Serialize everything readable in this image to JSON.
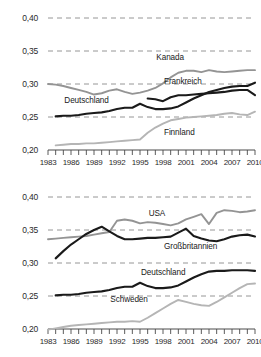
{
  "chart_data": [
    {
      "type": "line",
      "title": "",
      "xlabel": "",
      "ylabel": "",
      "xlim": [
        1983,
        2010
      ],
      "ylim": [
        0.2,
        0.4
      ],
      "grid": true,
      "legend_position": "inline-labels",
      "ytick_labels": [
        "0,40",
        "0,35",
        "0,30",
        "0,25",
        "0,20"
      ],
      "ytick_values": [
        0.4,
        0.35,
        0.3,
        0.25,
        0.2
      ],
      "xtick_labels": [
        "1983",
        "1986",
        "1989",
        "1992",
        "1995",
        "1998",
        "2001",
        "2004",
        "2007",
        "2010"
      ],
      "xtick_values": [
        1983,
        1986,
        1989,
        1992,
        1995,
        1998,
        2001,
        2004,
        2007,
        2010
      ],
      "series": [
        {
          "name": "Kanada",
          "color": "#949494",
          "label_x": 2000,
          "label_y": 0.338,
          "x": [
            1983,
            1984,
            1985,
            1986,
            1987,
            1988,
            1989,
            1990,
            1991,
            1992,
            1993,
            1994,
            1995,
            1996,
            1997,
            1998,
            1999,
            2000,
            2001,
            2002,
            2003,
            2004,
            2005,
            2006,
            2007,
            2008,
            2009,
            2010
          ],
          "values": [
            0.3,
            0.299,
            0.297,
            0.294,
            0.291,
            0.288,
            0.284,
            0.286,
            0.29,
            0.292,
            0.288,
            0.285,
            0.287,
            0.29,
            0.294,
            0.301,
            0.31,
            0.317,
            0.32,
            0.32,
            0.318,
            0.321,
            0.319,
            0.318,
            0.319,
            0.32,
            0.321,
            0.321
          ]
        },
        {
          "name": "Frankreich",
          "color": "#1a1a1a",
          "label_x": 2001,
          "label_y": 0.302,
          "x": [
            1996,
            1997,
            1998,
            1999,
            2000,
            2001,
            2002,
            2003,
            2004,
            2005,
            2006,
            2007,
            2008,
            2009,
            2010
          ],
          "values": [
            0.278,
            0.277,
            0.274,
            0.28,
            0.283,
            0.283,
            0.284,
            0.285,
            0.286,
            0.287,
            0.288,
            0.29,
            0.291,
            0.291,
            0.283
          ]
        },
        {
          "name": "Deutschland",
          "color": "#1a1a1a",
          "label_x": 1988,
          "label_y": 0.272,
          "x": [
            1984,
            1985,
            1986,
            1987,
            1988,
            1989,
            1990,
            1991,
            1992,
            1993,
            1994,
            1995,
            1996,
            1997,
            1998,
            1999,
            2000,
            2001,
            2002,
            2003,
            2004,
            2005,
            2006,
            2007,
            2008,
            2009,
            2010
          ],
          "values": [
            0.251,
            0.252,
            0.252,
            0.253,
            0.255,
            0.256,
            0.257,
            0.259,
            0.262,
            0.264,
            0.264,
            0.27,
            0.265,
            0.262,
            0.262,
            0.263,
            0.266,
            0.272,
            0.278,
            0.283,
            0.288,
            0.291,
            0.294,
            0.296,
            0.297,
            0.297,
            0.302
          ]
        },
        {
          "name": "Finnland",
          "color": "#b5b5b5",
          "label_x": 2001,
          "label_y": 0.224,
          "x": [
            1984,
            1985,
            1986,
            1987,
            1988,
            1989,
            1990,
            1991,
            1992,
            1993,
            1994,
            1995,
            1996,
            1997,
            1998,
            1999,
            2000,
            2001,
            2002,
            2003,
            2004,
            2005,
            2006,
            2007,
            2008,
            2009,
            2010
          ],
          "values": [
            0.207,
            0.208,
            0.209,
            0.209,
            0.21,
            0.21,
            0.211,
            0.212,
            0.213,
            0.214,
            0.215,
            0.216,
            0.226,
            0.234,
            0.24,
            0.245,
            0.247,
            0.249,
            0.25,
            0.251,
            0.252,
            0.253,
            0.255,
            0.256,
            0.254,
            0.253,
            0.258
          ]
        }
      ]
    },
    {
      "type": "line",
      "title": "",
      "xlabel": "",
      "ylabel": "",
      "xlim": [
        1983,
        2010
      ],
      "ylim": [
        0.2,
        0.4
      ],
      "grid": true,
      "legend_position": "inline-labels",
      "ytick_labels": [
        "0,40",
        "0,35",
        "0,30",
        "0,25",
        "0,20"
      ],
      "ytick_values": [
        0.4,
        0.35,
        0.3,
        0.25,
        0.2
      ],
      "xtick_labels": [
        "1983",
        "1986",
        "1989",
        "1992",
        "1995",
        "1998",
        "2001",
        "2004",
        "2007",
        "2010"
      ],
      "xtick_values": [
        1983,
        1986,
        1989,
        1992,
        1995,
        1998,
        2001,
        2004,
        2007,
        2010
      ],
      "series": [
        {
          "name": "USA",
          "color": "#949494",
          "label_x": 1999,
          "label_y": 0.372,
          "x": [
            1983,
            1984,
            1985,
            1986,
            1987,
            1988,
            1989,
            1990,
            1991,
            1992,
            1993,
            1994,
            1995,
            1996,
            1997,
            1998,
            1999,
            2000,
            2001,
            2002,
            2003,
            2004,
            2005,
            2006,
            2007,
            2008,
            2009,
            2010
          ],
          "values": [
            0.336,
            0.337,
            0.338,
            0.339,
            0.34,
            0.341,
            0.343,
            0.345,
            0.347,
            0.364,
            0.366,
            0.364,
            0.36,
            0.362,
            0.361,
            0.359,
            0.357,
            0.36,
            0.366,
            0.37,
            0.374,
            0.359,
            0.376,
            0.38,
            0.379,
            0.377,
            0.378,
            0.38
          ]
        },
        {
          "name": "Großbritannien",
          "color": "#1a1a1a",
          "label_x": 2001,
          "label_y": 0.322,
          "x": [
            1984,
            1985,
            1986,
            1987,
            1988,
            1989,
            1990,
            1991,
            1992,
            1993,
            1994,
            1995,
            1996,
            1997,
            1998,
            1999,
            2000,
            2001,
            2002,
            2003,
            2004,
            2005,
            2006,
            2007,
            2008,
            2009,
            2010
          ],
          "values": [
            0.307,
            0.318,
            0.328,
            0.336,
            0.344,
            0.35,
            0.355,
            0.348,
            0.341,
            0.336,
            0.336,
            0.337,
            0.338,
            0.338,
            0.339,
            0.34,
            0.346,
            0.352,
            0.341,
            0.337,
            0.334,
            0.333,
            0.336,
            0.34,
            0.342,
            0.343,
            0.34
          ]
        },
        {
          "name": "Deutschland",
          "color": "#1a1a1a",
          "label_x": 1998,
          "label_y": 0.283,
          "x": [
            1984,
            1985,
            1986,
            1987,
            1988,
            1989,
            1990,
            1991,
            1992,
            1993,
            1994,
            1995,
            1996,
            1997,
            1998,
            1999,
            2000,
            2001,
            2002,
            2003,
            2004,
            2005,
            2006,
            2007,
            2008,
            2009,
            2010
          ],
          "values": [
            0.251,
            0.252,
            0.252,
            0.253,
            0.255,
            0.256,
            0.257,
            0.259,
            0.262,
            0.264,
            0.264,
            0.27,
            0.265,
            0.262,
            0.262,
            0.263,
            0.266,
            0.272,
            0.278,
            0.283,
            0.287,
            0.288,
            0.288,
            0.289,
            0.289,
            0.289,
            0.288
          ]
        },
        {
          "name": "Schweden",
          "color": "#b5b5b5",
          "label_x": 1994,
          "label_y": 0.243,
          "x": [
            1983,
            1984,
            1985,
            1986,
            1987,
            1988,
            1989,
            1990,
            1991,
            1992,
            1993,
            1994,
            1995,
            1996,
            1997,
            1998,
            1999,
            2000,
            2001,
            2002,
            2003,
            2004,
            2005,
            2006,
            2007,
            2008,
            2009,
            2010
          ],
          "values": [
            0.199,
            0.201,
            0.203,
            0.205,
            0.206,
            0.207,
            0.208,
            0.209,
            0.21,
            0.211,
            0.211,
            0.212,
            0.211,
            0.217,
            0.224,
            0.231,
            0.238,
            0.244,
            0.241,
            0.238,
            0.236,
            0.235,
            0.241,
            0.248,
            0.255,
            0.262,
            0.268,
            0.269
          ]
        }
      ]
    }
  ]
}
